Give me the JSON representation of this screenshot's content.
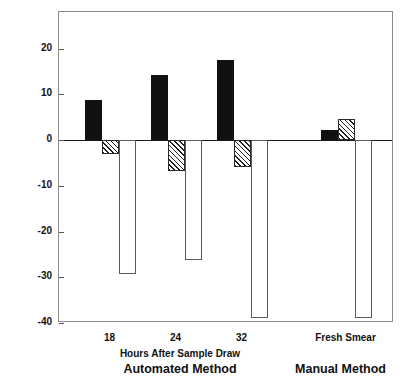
{
  "chart_data": {
    "type": "bar",
    "title": "",
    "subtitle": "",
    "xlabel": "Hours After Sample Draw",
    "ylabel": "% Difference from Automated Method on Fresh Samples",
    "ylim": [
      -40,
      28
    ],
    "yticks": [
      20,
      10,
      0,
      -10,
      -20,
      -30,
      -40
    ],
    "ytick_labels": [
      "20",
      "10",
      "0",
      "-10",
      "-20",
      "-30",
      "-40"
    ],
    "grid": false,
    "legend_position": "none",
    "categories": [
      "18",
      "24",
      "32",
      "Fresh Smear"
    ],
    "series": [
      {
        "name": "solid",
        "fill": "solid-black",
        "values": [
          8.7,
          14.2,
          17.5,
          2.3
        ]
      },
      {
        "name": "hatched",
        "fill": "diagonal-hatch",
        "values": [
          -3.0,
          -6.7,
          -5.8,
          4.5
        ]
      },
      {
        "name": "open",
        "fill": "open-white",
        "values": [
          -29.3,
          -26.2,
          -39.0,
          -39.0
        ]
      }
    ],
    "groups": [
      {
        "category": "18",
        "panel": "Automated Method",
        "bars": [
          {
            "series": "solid",
            "value": 8.7
          },
          {
            "series": "hatched",
            "value": -3.0
          },
          {
            "series": "open",
            "value": -29.3
          }
        ]
      },
      {
        "category": "24",
        "panel": "Automated Method",
        "bars": [
          {
            "series": "solid",
            "value": 14.2
          },
          {
            "series": "hatched",
            "value": -6.7
          },
          {
            "series": "open",
            "value": -26.2
          }
        ]
      },
      {
        "category": "32",
        "panel": "Automated Method",
        "bars": [
          {
            "series": "solid",
            "value": 17.5
          },
          {
            "series": "hatched",
            "value": -5.8
          },
          {
            "series": "open",
            "value": -39.0
          }
        ]
      },
      {
        "category": "Fresh Smear",
        "panel": "Manual Method",
        "bars": [
          {
            "series": "solid",
            "value": 2.3
          },
          {
            "series": "hatched",
            "value": 4.5
          },
          {
            "series": "open",
            "value": -39.0
          }
        ]
      }
    ],
    "panels": [
      {
        "label": "Automated Method",
        "sub_label": "Hours After Sample Draw",
        "categories": [
          "18",
          "24",
          "32"
        ]
      },
      {
        "label": "Manual Method",
        "sub_label": "",
        "categories": [
          "Fresh Smear"
        ]
      }
    ]
  },
  "axis": {
    "y_title": "% Difference from Automated Method on Fresh Samples",
    "y_ticks": [
      {
        "label": "20",
        "value": 20
      },
      {
        "label": "10",
        "value": 10
      },
      {
        "label": "0",
        "value": 0
      },
      {
        "label": "-10",
        "value": -10
      },
      {
        "label": "-20",
        "value": -20
      },
      {
        "label": "-30",
        "value": -30
      },
      {
        "label": "-40",
        "value": -40
      }
    ],
    "x_ticks": [
      {
        "label": "18"
      },
      {
        "label": "24"
      },
      {
        "label": "32"
      },
      {
        "label": "Fresh Smear"
      }
    ],
    "x_sub_label": "Hours After Sample Draw",
    "x_group_labels": [
      {
        "label": "Automated Method"
      },
      {
        "label": "Manual Method"
      }
    ]
  },
  "colors": {
    "solid_bar": "#111111",
    "hatch_line": "#222222",
    "open_bar_border": "#5a5a5a",
    "frame": "#8a8a8a",
    "zero_line": "#1a1a1a",
    "background": "#ffffff",
    "text": "#111111"
  }
}
